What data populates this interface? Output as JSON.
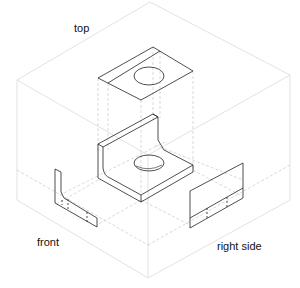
{
  "diagram": {
    "labels": {
      "top": "top",
      "front": "front",
      "right_side": "right side"
    },
    "colors": {
      "box_line": "#d0d0d0",
      "projection_line": "#b8b8b8",
      "object_line": "#222222",
      "background": "#ffffff"
    }
  }
}
